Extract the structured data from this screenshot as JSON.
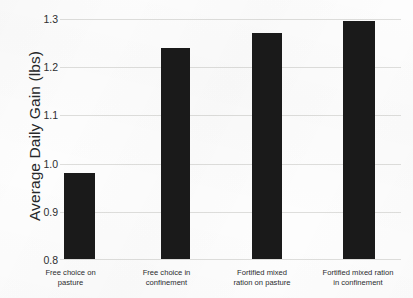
{
  "chart_data": {
    "type": "bar",
    "title": "",
    "xlabel": "",
    "ylabel": "Average Daily Gain (lbs)",
    "ylim": [
      0.8,
      1.3
    ],
    "yticks": [
      "1.3",
      "1.2",
      "1.1",
      "1.0",
      "0.9",
      "0.8"
    ],
    "grid": true,
    "legend": "none",
    "bar_color": "#1a1a1a",
    "gridline_color": "#dededc",
    "background_color": "#fdfdfd",
    "categories": [
      "Free choice on\npasture",
      "Free choice in\nconfinement",
      "Fortified mixed\nration on pasture",
      "Fortified mixed ration\nin confinement"
    ],
    "values": [
      0.98,
      1.24,
      1.27,
      1.295
    ]
  }
}
